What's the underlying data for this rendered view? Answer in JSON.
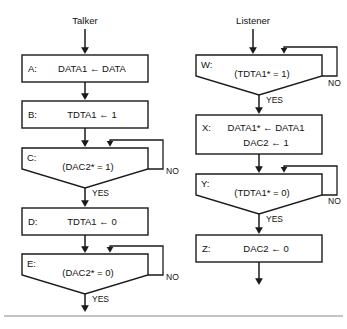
{
  "figure": {
    "title_left": "Talker",
    "title_right": "Listener",
    "background": "#ffffff",
    "line_color": "#1a1a1a",
    "rule_color": "#8a8a8a"
  },
  "labels": {
    "yes": "YES",
    "no": "NO"
  },
  "talker": {
    "steps": [
      {
        "tag": "A:",
        "shape": "process",
        "lines": [
          "DATA1 ←  DATA"
        ],
        "branch": null
      },
      {
        "tag": "B:",
        "shape": "process",
        "lines": [
          "TDTA1  ← 1"
        ],
        "branch": null
      },
      {
        "tag": "C:",
        "shape": "decision",
        "lines": [
          "(DAC2* = 1)"
        ],
        "branch": {
          "no": "NO",
          "yes": "YES"
        }
      },
      {
        "tag": "D:",
        "shape": "process",
        "lines": [
          "TDTA1 ←  0"
        ],
        "branch": null
      },
      {
        "tag": "E:",
        "shape": "decision",
        "lines": [
          "(DAC2* = 0)"
        ],
        "branch": {
          "no": "NO",
          "yes": "YES"
        }
      }
    ]
  },
  "listener": {
    "steps": [
      {
        "tag": "W:",
        "shape": "decision",
        "lines": [
          "(TDTA1* = 1)"
        ],
        "branch": {
          "no": "NO",
          "yes": "YES"
        }
      },
      {
        "tag": "X:",
        "shape": "process",
        "lines": [
          "DATA1* ←  DATA1",
          "DAC2 ← 1"
        ],
        "branch": null
      },
      {
        "tag": "Y:",
        "shape": "decision",
        "lines": [
          "(TDTA1* = 0)"
        ],
        "branch": {
          "no": "NO",
          "yes": "YES"
        }
      },
      {
        "tag": "Z:",
        "shape": "process",
        "lines": [
          "DAC2 ← 0"
        ],
        "branch": null
      }
    ]
  }
}
